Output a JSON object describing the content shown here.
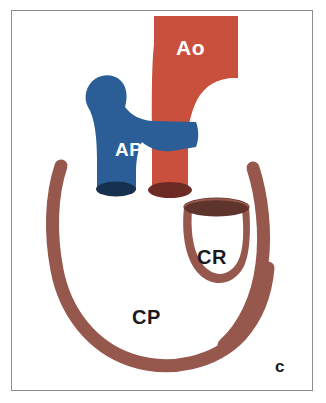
{
  "figure": {
    "panel_letter": "c",
    "background_color": "#ffffff",
    "frame_color": "#8d8d8d"
  },
  "labels": {
    "aorta": "Ao",
    "pulmonary_artery": "AP",
    "coronary_right": "CR",
    "coronary_posterior": "CP"
  },
  "colors": {
    "aorta_fill": "#c8503c",
    "aorta_lumen": "#6d2b26",
    "pulmonary_fill": "#2b5e96",
    "pulmonary_lumen": "#16304f",
    "coronary_fill": "#96574c",
    "coronary_lumen": "#5e342c",
    "label_light": "#ffffff",
    "label_dark": "#1a1a1a"
  }
}
